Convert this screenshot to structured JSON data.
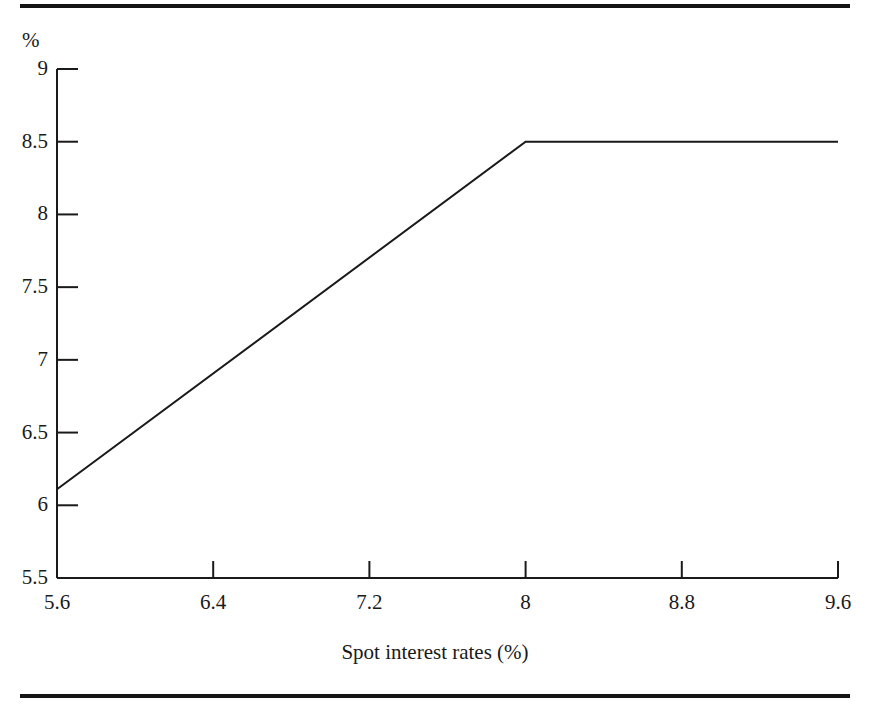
{
  "figure": {
    "background_color": "#ffffff",
    "ink_color": "#1a1a1a",
    "rule_color": "#141414",
    "top_rule_name": "top-horizontal-rule",
    "bottom_rule_name": "bottom-horizontal-rule"
  },
  "chart_data": {
    "type": "line",
    "title": "",
    "subtitle": "",
    "xlabel": "Spot interest rates (%)",
    "ylabel": "",
    "y_unit_label": "%",
    "xlim": [
      5.6,
      9.6
    ],
    "ylim": [
      5.5,
      9.0
    ],
    "xticks": [
      5.6,
      6.4,
      7.2,
      8.0,
      8.8,
      9.6
    ],
    "xtick_labels": [
      "5.6",
      "6.4",
      "7.2",
      "8",
      "8.8",
      "9.6"
    ],
    "yticks": [
      5.5,
      6.0,
      6.5,
      7.0,
      7.5,
      8.0,
      8.5,
      9.0
    ],
    "ytick_labels": [
      "5.5",
      "6",
      "6.5",
      "7",
      "7.5",
      "8",
      "8.5",
      "9"
    ],
    "grid": false,
    "legend": null,
    "legend_position": "none",
    "series": [
      {
        "name": "Capped floating rate",
        "color": "#1a1a1a",
        "line_width": 2,
        "x": [
          5.6,
          8.0,
          9.6
        ],
        "y": [
          6.11,
          8.5,
          8.5
        ]
      }
    ],
    "annotations": [
      {
        "text": "Kink at cap",
        "x": 8.0,
        "y": 8.5
      }
    ]
  },
  "axis": {
    "unit_label": "%",
    "x_title": "Spot interest rates (%)"
  }
}
